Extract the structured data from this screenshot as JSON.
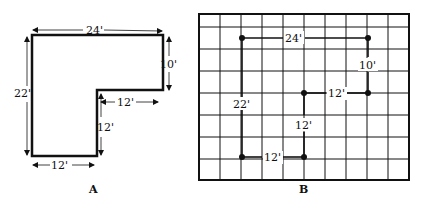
{
  "panel_a": {
    "caption": "A",
    "dimensions": {
      "top": "24'",
      "right": "10'",
      "left": "22'",
      "inner_horizontal": "12'",
      "inner_vertical": "12'",
      "bottom": "12'"
    }
  },
  "panel_b": {
    "caption": "B",
    "grid": {
      "columns": 10,
      "rows": 8
    },
    "labels": {
      "top": "24'",
      "right": "10'",
      "left": "22'",
      "inner_horizontal": "12'",
      "inner_vertical": "12'",
      "bottom": "12'"
    }
  },
  "colors": {
    "ink": "#111111",
    "background": "#ffffff"
  }
}
